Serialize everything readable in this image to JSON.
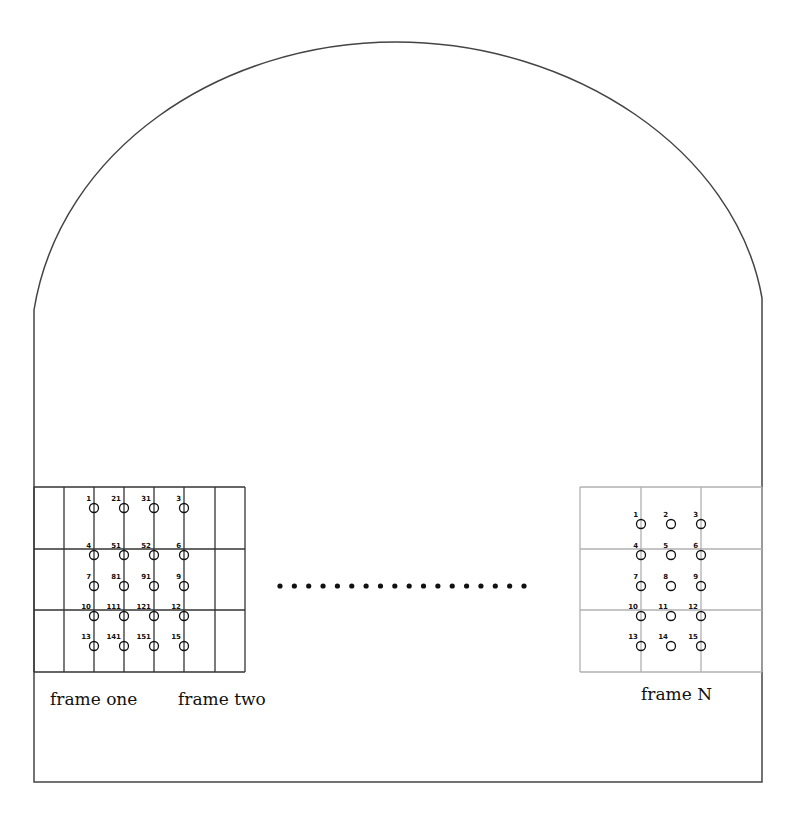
{
  "diagram": {
    "enclosure": {
      "arch_top": [
        396,
        42
      ],
      "left_wall_x": 34,
      "right_wall_x": 762,
      "wall_start_y": 310,
      "floor_y": 782,
      "stroke": "#444444"
    },
    "frames": [
      {
        "name": "frame-one-and-two",
        "grid_color": "#333333",
        "x": 34,
        "y": 487,
        "cols": [
          34,
          64,
          94,
          124,
          154,
          184,
          215,
          245
        ],
        "rows": [
          487,
          549,
          610,
          672
        ],
        "nodes": [
          {
            "label": "1",
            "x": 94,
            "y": 502
          },
          {
            "label": "21",
            "x": 124,
            "y": 502
          },
          {
            "label": "31",
            "x": 154,
            "y": 502
          },
          {
            "label": "3",
            "x": 184,
            "y": 502
          },
          {
            "label": "4",
            "x": 94,
            "y": 549
          },
          {
            "label": "51",
            "x": 124,
            "y": 549
          },
          {
            "label": "52",
            "x": 154,
            "y": 549
          },
          {
            "label": "6",
            "x": 184,
            "y": 549
          },
          {
            "label": "7",
            "x": 94,
            "y": 580
          },
          {
            "label": "81",
            "x": 124,
            "y": 580
          },
          {
            "label": "91",
            "x": 154,
            "y": 580
          },
          {
            "label": "9",
            "x": 184,
            "y": 580
          },
          {
            "label": "10",
            "x": 94,
            "y": 610
          },
          {
            "label": "111",
            "x": 124,
            "y": 610
          },
          {
            "label": "121",
            "x": 154,
            "y": 610
          },
          {
            "label": "12",
            "x": 184,
            "y": 610
          },
          {
            "label": "13",
            "x": 94,
            "y": 640
          },
          {
            "label": "141",
            "x": 124,
            "y": 640
          },
          {
            "label": "151",
            "x": 154,
            "y": 640
          },
          {
            "label": "15",
            "x": 184,
            "y": 640
          }
        ]
      },
      {
        "name": "frame-n",
        "grid_color": "#b0b0b0",
        "x": 580,
        "y": 487,
        "cols": [
          580,
          641,
          701,
          762
        ],
        "rows": [
          487,
          549,
          610,
          672
        ],
        "nodes": [
          {
            "label": "1",
            "x": 641,
            "y": 518
          },
          {
            "label": "2",
            "x": 671,
            "y": 518
          },
          {
            "label": "3",
            "x": 701,
            "y": 518
          },
          {
            "label": "4",
            "x": 641,
            "y": 549
          },
          {
            "label": "5",
            "x": 671,
            "y": 549
          },
          {
            "label": "6",
            "x": 701,
            "y": 549
          },
          {
            "label": "7",
            "x": 641,
            "y": 580
          },
          {
            "label": "8",
            "x": 671,
            "y": 580
          },
          {
            "label": "9",
            "x": 701,
            "y": 580
          },
          {
            "label": "10",
            "x": 641,
            "y": 610
          },
          {
            "label": "11",
            "x": 671,
            "y": 610
          },
          {
            "label": "12",
            "x": 701,
            "y": 610
          },
          {
            "label": "13",
            "x": 641,
            "y": 640
          },
          {
            "label": "14",
            "x": 671,
            "y": 640
          },
          {
            "label": "15",
            "x": 701,
            "y": 640
          }
        ]
      }
    ],
    "labels": {
      "frame_one": "frame one",
      "frame_two": "frame two",
      "frame_n": "frame N"
    },
    "ellipsis": {
      "dots": 18,
      "x_start": 280,
      "x_end": 524,
      "y": 586
    }
  }
}
